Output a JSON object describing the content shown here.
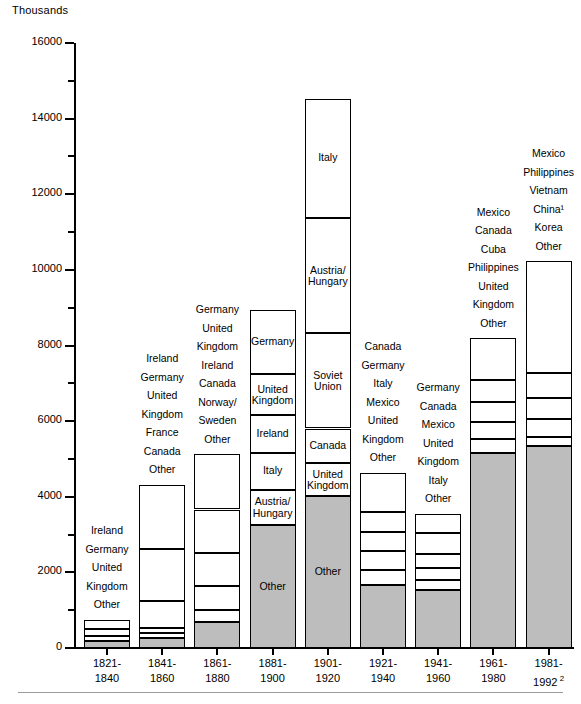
{
  "chart_data": {
    "type": "bar",
    "subtype": "stacked-bar",
    "title": "",
    "xlabel": "",
    "ylabel": "Thousands",
    "ylim": [
      0,
      16000
    ],
    "ytick_step": 2000,
    "yminor_step": 1000,
    "grid": false,
    "legend": "none",
    "units_note": "Thousands",
    "categories": [
      "1821-\n1840",
      "1841-\n1860",
      "1861-\n1880",
      "1881-\n1900",
      "1901-\n1920",
      "1921-\n1940",
      "1941-\n1960",
      "1961-\n1980",
      "1981-\n1992"
    ],
    "tick_labels": [
      "0",
      "2000",
      "4000",
      "6000",
      "8000",
      "10000",
      "12000",
      "14000",
      "16000"
    ],
    "totals": [
      751,
      4311,
      5127,
      8935,
      14531,
      4636,
      3551,
      8188,
      10229
    ],
    "footnote_marker": "2",
    "bars": [
      {
        "period": "1821-1840",
        "total": 751,
        "labels_outside": [
          "Ireland",
          "Germany",
          "United\nKingdom",
          "Other"
        ],
        "segments": [
          {
            "name": "Ireland",
            "value": 261,
            "shaded": false,
            "label_inside": ""
          },
          {
            "name": "Germany",
            "value": 160,
            "shaded": false,
            "label_inside": ""
          },
          {
            "name": "United Kingdom",
            "value": 150,
            "shaded": false,
            "label_inside": ""
          },
          {
            "name": "Other",
            "value": 180,
            "shaded": true,
            "label_inside": ""
          }
        ]
      },
      {
        "period": "1841-1860",
        "total": 4311,
        "labels_outside": [
          "Ireland",
          "Germany",
          "United\nKingdom",
          "France",
          "Canada",
          "Other"
        ],
        "segments": [
          {
            "name": "Ireland",
            "value": 1694,
            "shaded": false,
            "label_inside": ""
          },
          {
            "name": "Germany",
            "value": 1385,
            "shaded": false,
            "label_inside": ""
          },
          {
            "name": "United Kingdom",
            "value": 690,
            "shaded": false,
            "label_inside": ""
          },
          {
            "name": "France",
            "value": 154,
            "shaded": false,
            "label_inside": ""
          },
          {
            "name": "Canada",
            "value": 120,
            "shaded": false,
            "label_inside": ""
          },
          {
            "name": "Other",
            "value": 268,
            "shaded": true,
            "label_inside": ""
          }
        ]
      },
      {
        "period": "1861-1880",
        "total": 5127,
        "labels_outside": [
          "Germany",
          "United\nKingdom",
          "Ireland",
          "Canada",
          "Norway/\nSweden",
          "Other"
        ],
        "segments": [
          {
            "name": "Germany",
            "value": 1464,
            "shaded": false,
            "label_inside": ""
          },
          {
            "name": "United Kingdom",
            "value": 1154,
            "shaded": false,
            "label_inside": ""
          },
          {
            "name": "Ireland",
            "value": 871,
            "shaded": false,
            "label_inside": ""
          },
          {
            "name": "Canada",
            "value": 636,
            "shaded": false,
            "label_inside": ""
          },
          {
            "name": "Norway/Sweden",
            "value": 321,
            "shaded": false,
            "label_inside": ""
          },
          {
            "name": "Other",
            "value": 681,
            "shaded": true,
            "label_inside": ""
          }
        ]
      },
      {
        "period": "1881-1900",
        "total": 8935,
        "labels_outside": [],
        "segments": [
          {
            "name": "Germany",
            "value": 1698,
            "shaded": false,
            "label_inside": "Germany"
          },
          {
            "name": "United Kingdom",
            "value": 1088,
            "shaded": false,
            "label_inside": "United\nKingdom"
          },
          {
            "name": "Ireland",
            "value": 1000,
            "shaded": false,
            "label_inside": "Ireland"
          },
          {
            "name": "Italy",
            "value": 958,
            "shaded": false,
            "label_inside": "Italy"
          },
          {
            "name": "Austria/Hungary",
            "value": 944,
            "shaded": false,
            "label_inside": "Austria/\nHungary"
          },
          {
            "name": "Other",
            "value": 3247,
            "shaded": true,
            "label_inside": "Other"
          }
        ]
      },
      {
        "period": "1901-1920",
        "total": 14531,
        "labels_outside": [],
        "segments": [
          {
            "name": "Italy",
            "value": 3156,
            "shaded": false,
            "label_inside": "Italy"
          },
          {
            "name": "Austria/Hungary",
            "value": 3050,
            "shaded": false,
            "label_inside": "Austria/\nHungary"
          },
          {
            "name": "Soviet Union",
            "value": 2520,
            "shaded": false,
            "label_inside": "Soviet\nUnion"
          },
          {
            "name": "Canada",
            "value": 921,
            "shaded": false,
            "label_inside": "Canada"
          },
          {
            "name": "United Kingdom",
            "value": 867,
            "shaded": false,
            "label_inside": "United\nKingdom"
          },
          {
            "name": "Other",
            "value": 4017,
            "shaded": true,
            "label_inside": "Other"
          }
        ]
      },
      {
        "period": "1921-1940",
        "total": 4636,
        "labels_outside": [
          "Canada",
          "Germany",
          "Italy",
          "Mexico",
          "United\nKingdom",
          "Other"
        ],
        "segments": [
          {
            "name": "Canada",
            "value": 1033,
            "shaded": false,
            "label_inside": ""
          },
          {
            "name": "Germany",
            "value": 526,
            "shaded": false,
            "label_inside": ""
          },
          {
            "name": "Italy",
            "value": 524,
            "shaded": false,
            "label_inside": ""
          },
          {
            "name": "Mexico",
            "value": 481,
            "shaded": false,
            "label_inside": ""
          },
          {
            "name": "United Kingdom",
            "value": 398,
            "shaded": false,
            "label_inside": ""
          },
          {
            "name": "Other",
            "value": 1674,
            "shaded": true,
            "label_inside": ""
          }
        ]
      },
      {
        "period": "1941-1960",
        "total": 3551,
        "labels_outside": [
          "Germany",
          "Canada",
          "Mexico",
          "United\nKingdom",
          "Italy",
          "Other"
        ],
        "segments": [
          {
            "name": "Germany",
            "value": 516,
            "shaded": false,
            "label_inside": ""
          },
          {
            "name": "Canada",
            "value": 549,
            "shaded": false,
            "label_inside": ""
          },
          {
            "name": "Mexico",
            "value": 359,
            "shaded": false,
            "label_inside": ""
          },
          {
            "name": "United Kingdom",
            "value": 341,
            "shaded": false,
            "label_inside": ""
          },
          {
            "name": "Italy",
            "value": 242,
            "shaded": false,
            "label_inside": ""
          },
          {
            "name": "Other",
            "value": 1544,
            "shaded": true,
            "label_inside": ""
          }
        ]
      },
      {
        "period": "1961-1980",
        "total": 8188,
        "labels_outside": [
          "Mexico",
          "Canada",
          "Cuba",
          "Philippines",
          "United\nKingdom",
          "Other"
        ],
        "segments": [
          {
            "name": "Mexico",
            "value": 1093,
            "shaded": false,
            "label_inside": ""
          },
          {
            "name": "Canada",
            "value": 590,
            "shaded": false,
            "label_inside": ""
          },
          {
            "name": "Cuba",
            "value": 533,
            "shaded": false,
            "label_inside": ""
          },
          {
            "name": "Philippines",
            "value": 453,
            "shaded": false,
            "label_inside": ""
          },
          {
            "name": "United Kingdom",
            "value": 350,
            "shaded": false,
            "label_inside": ""
          },
          {
            "name": "Other",
            "value": 5169,
            "shaded": true,
            "label_inside": ""
          }
        ]
      },
      {
        "period": "1981-1992",
        "total": 10229,
        "labels_outside": [
          "Mexico",
          "Philippines",
          "Vietnam",
          "China¹",
          "Korea",
          "Other"
        ],
        "segments": [
          {
            "name": "Mexico",
            "value": 2967,
            "shaded": false,
            "label_inside": ""
          },
          {
            "name": "Philippines",
            "value": 663,
            "shaded": false,
            "label_inside": ""
          },
          {
            "name": "Vietnam",
            "value": 536,
            "shaded": false,
            "label_inside": ""
          },
          {
            "name": "China",
            "value": 472,
            "shaded": false,
            "label_inside": ""
          },
          {
            "name": "Korea",
            "value": 256,
            "shaded": false,
            "label_inside": ""
          },
          {
            "name": "Other",
            "value": 5335,
            "shaded": true,
            "label_inside": ""
          }
        ]
      }
    ],
    "colors": {
      "bar_fill": "#ffffff",
      "bar_shaded_fill": "#bdbdbd",
      "bar_stroke": "#000000",
      "axis": "#000000",
      "text": "#000000",
      "footrule": "#9a9a9a"
    }
  }
}
